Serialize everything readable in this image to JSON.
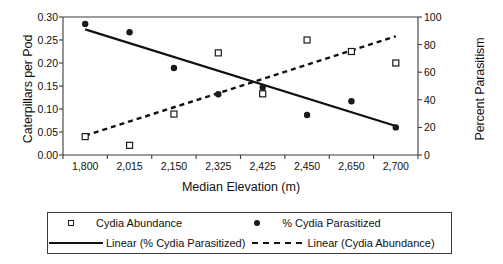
{
  "chart_data": {
    "type": "scatter",
    "title": "",
    "xlabel": "Median Elevation (m)",
    "ylabel": "Caterpillars per Pod",
    "y2label": "Percent Parasitism",
    "categories": [
      "1,800",
      "2,015",
      "2,150",
      "2,325",
      "2,425",
      "2,450",
      "2,650",
      "2,700"
    ],
    "x_values": [
      1800,
      2015,
      2150,
      2325,
      2425,
      2450,
      2650,
      2700
    ],
    "ylim": [
      0.0,
      0.3
    ],
    "y2lim": [
      0,
      100
    ],
    "yticks": [
      "0.00",
      "0.05",
      "0.10",
      "0.15",
      "0.20",
      "0.25",
      "0.30"
    ],
    "ytick_values": [
      0.0,
      0.05,
      0.1,
      0.15,
      0.2,
      0.25,
      0.3
    ],
    "y2ticks": [
      "0",
      "20",
      "40",
      "60",
      "80",
      "100"
    ],
    "y2tick_values": [
      0,
      20,
      40,
      60,
      80,
      100
    ],
    "grid": false,
    "legend_position": "below",
    "series": [
      {
        "name": "Cydia Abundance",
        "marker": "open-square",
        "axis": "left",
        "values": [
          0.04,
          0.021,
          0.089,
          0.222,
          0.133,
          0.25,
          0.225,
          0.2
        ]
      },
      {
        "name": "% Cydia Parasitized",
        "marker": "filled-circle",
        "axis": "right",
        "values": [
          95,
          89,
          63,
          44,
          49,
          29,
          39,
          20
        ]
      },
      {
        "name": "Linear (% Cydia Parasitized)",
        "type": "trendline",
        "style": "solid",
        "axis": "right",
        "endpoints": [
          {
            "x": 1800,
            "y": 91
          },
          {
            "x": 2700,
            "y": 21
          }
        ]
      },
      {
        "name": "Linear (Cydia Abundance)",
        "type": "trendline",
        "style": "dashed",
        "axis": "left",
        "endpoints": [
          {
            "x": 1800,
            "y": 0.042
          },
          {
            "x": 2700,
            "y": 0.258
          }
        ]
      }
    ]
  },
  "legend": {
    "items": [
      {
        "label": "Cydia Abundance",
        "key": "open-square"
      },
      {
        "label": "% Cydia Parasitized",
        "key": "filled-circle"
      },
      {
        "label": "Linear (% Cydia Parasitized)",
        "key": "solid-line"
      },
      {
        "label": "Linear (Cydia Abundance)",
        "key": "dashed-line"
      }
    ]
  },
  "colors": {
    "axis": "#3b3b3b",
    "marker": "#1a1a1a",
    "text": "#111111",
    "background": "#ffffff"
  }
}
